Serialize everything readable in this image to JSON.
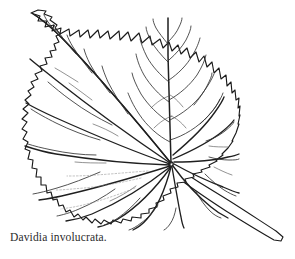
{
  "figure": {
    "caption": "Davidia involucrata.",
    "subject_name": "Davidia involucrata",
    "illustration_type": "botanical line drawing",
    "specimen_part": "leaf",
    "leaf_shape": "cordate",
    "margin_type": "serrate",
    "venation_type": "palmate-pinnate",
    "medium": "ink line drawing"
  },
  "colors": {
    "background": "#ffffff",
    "ink_outline": "#1a1a1a",
    "ink_primary_vein": "#1f1f1f",
    "ink_secondary_vein": "#333333",
    "ink_tertiary_vein": "#4a4a4a",
    "ink_faint_vein": "#8c8c8c",
    "caption_text": "#2b2b2b"
  },
  "canvas": {
    "width": 295,
    "height": 259
  },
  "parts": {
    "blade_label": "leaf blade",
    "petiole_label": "petiole",
    "midrib_label": "midrib",
    "base_label": "leaf base vein junction",
    "apex_label": "leaf apex"
  }
}
